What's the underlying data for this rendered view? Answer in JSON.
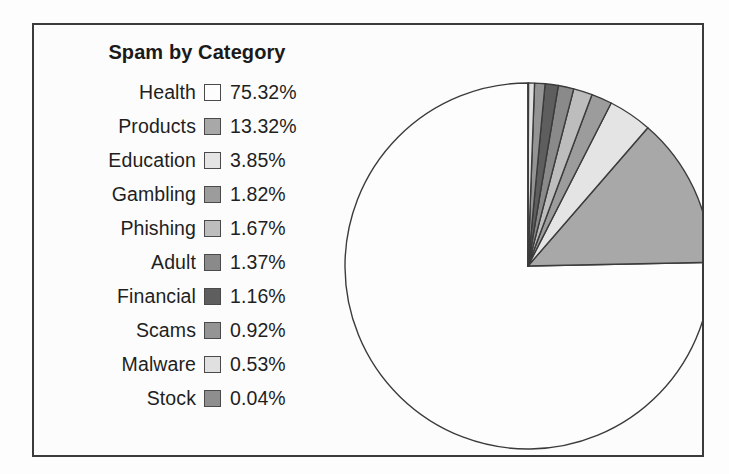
{
  "figure": {
    "background_color": "#fdfdfd",
    "frame_color": "#3b3b3b",
    "frame_background": "#fcfcfc"
  },
  "legend": {
    "title": "Spam by Category",
    "position": "left-inside",
    "rows": [
      {
        "label": "Health",
        "value": "75.32%",
        "color": "#fdfdfd"
      },
      {
        "label": "Products",
        "value": "13.32%",
        "color": "#a8a8a8"
      },
      {
        "label": "Education",
        "value": "3.85%",
        "color": "#e4e4e4"
      },
      {
        "label": "Gambling",
        "value": "1.82%",
        "color": "#9c9c9c"
      },
      {
        "label": "Phishing",
        "value": "1.67%",
        "color": "#bdbdbd"
      },
      {
        "label": "Adult",
        "value": "1.37%",
        "color": "#8a8a8a"
      },
      {
        "label": "Financial",
        "value": "1.16%",
        "color": "#5e5e5e"
      },
      {
        "label": "Scams",
        "value": "0.92%",
        "color": "#949494"
      },
      {
        "label": "Malware",
        "value": "0.53%",
        "color": "#e0e0e0"
      },
      {
        "label": "Stock",
        "value": "0.04%",
        "color": "#8e8e8e"
      }
    ]
  },
  "chart_data": {
    "type": "pie",
    "title": "Spam by Category",
    "xlabel": "",
    "ylabel": "",
    "units": "percent",
    "start_angle_deg": 90,
    "direction": "counterclockwise",
    "edge_color": "#3b3b3b",
    "edge_width": 1.4,
    "center": {
      "x": 494,
      "y": 241
    },
    "radius": 183,
    "categories": [
      "Health",
      "Products",
      "Education",
      "Gambling",
      "Phishing",
      "Adult",
      "Financial",
      "Scams",
      "Malware",
      "Stock"
    ],
    "values": [
      75.32,
      13.32,
      3.85,
      1.82,
      1.67,
      1.37,
      1.16,
      0.92,
      0.53,
      0.04
    ],
    "colors": [
      "#fdfdfd",
      "#a8a8a8",
      "#e4e4e4",
      "#9c9c9c",
      "#bdbdbd",
      "#8a8a8a",
      "#5e5e5e",
      "#949494",
      "#e0e0e0",
      "#8e8e8e"
    ],
    "labels_shown_on_slices": false,
    "legend_position": "left"
  }
}
